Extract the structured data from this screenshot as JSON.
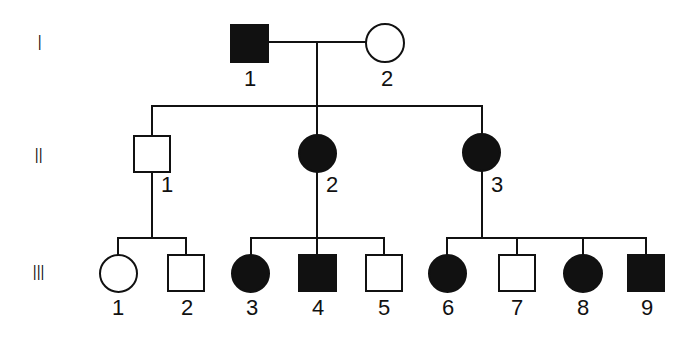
{
  "colors": {
    "affected": "#111111",
    "unaffected": "#ffffff",
    "line": "#111111"
  },
  "generations": [
    {
      "label": "I"
    },
    {
      "label": "II"
    },
    {
      "label": "III"
    }
  ],
  "individuals": {
    "I": [
      {
        "id": "1",
        "sex": "male",
        "affected": true
      },
      {
        "id": "2",
        "sex": "female",
        "affected": false
      }
    ],
    "II": [
      {
        "id": "1",
        "sex": "male",
        "affected": false
      },
      {
        "id": "2",
        "sex": "female",
        "affected": true
      },
      {
        "id": "3",
        "sex": "female",
        "affected": true
      }
    ],
    "III": [
      {
        "id": "1",
        "sex": "female",
        "affected": false
      },
      {
        "id": "2",
        "sex": "male",
        "affected": false
      },
      {
        "id": "3",
        "sex": "female",
        "affected": true
      },
      {
        "id": "4",
        "sex": "male",
        "affected": true
      },
      {
        "id": "5",
        "sex": "male",
        "affected": false
      },
      {
        "id": "6",
        "sex": "female",
        "affected": true
      },
      {
        "id": "7",
        "sex": "male",
        "affected": false
      },
      {
        "id": "8",
        "sex": "female",
        "affected": true
      },
      {
        "id": "9",
        "sex": "male",
        "affected": true
      }
    ]
  }
}
